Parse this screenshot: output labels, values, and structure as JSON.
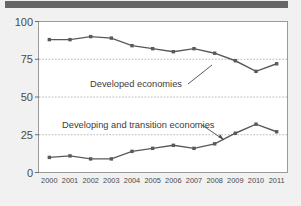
{
  "figure": {
    "header_bar_color": "#666666",
    "background_color": "#f1f1f1",
    "plot_background_color": "#ffffff",
    "plot_border_color": "#9a9a9a",
    "line_color": "#595959",
    "gridline_color": "#b4b4b4",
    "text_color": "#4a4a4a"
  },
  "chart_data": {
    "type": "line",
    "title": "",
    "subtitle": "",
    "xlabel": "",
    "ylabel": "",
    "categories": [
      "2000",
      "2001",
      "2002",
      "2003",
      "2004",
      "2005",
      "2006",
      "2007",
      "2008",
      "2009",
      "2010",
      "2011"
    ],
    "x": [
      2000,
      2001,
      2002,
      2003,
      2004,
      2005,
      2006,
      2007,
      2008,
      2009,
      2010,
      2011
    ],
    "ylim": [
      0,
      100
    ],
    "yticks": [
      0,
      25,
      50,
      75,
      100
    ],
    "ytick_labels": [
      "0",
      "25",
      "50",
      "75",
      "100"
    ],
    "grid": true,
    "grid_style": "dotted-horizontal",
    "legend": "inline-annotations",
    "marker": "square",
    "series": [
      {
        "name": "Developed economies",
        "values": [
          88,
          88,
          90,
          89,
          84,
          82,
          80,
          82,
          79,
          74,
          67,
          72
        ],
        "color": "#595959"
      },
      {
        "name": "Developing and transition economies",
        "values": [
          10,
          11,
          9,
          9,
          14,
          16,
          18,
          16,
          19,
          26,
          32,
          27
        ],
        "color": "#595959"
      }
    ],
    "annotations": [
      {
        "text": "Developed economies",
        "points_to_series": "Developed economies",
        "points_to_category": "2008"
      },
      {
        "text": "Developing and transition economies",
        "points_to_series": "Developing and transition economies",
        "points_to_category": "2009"
      }
    ]
  }
}
